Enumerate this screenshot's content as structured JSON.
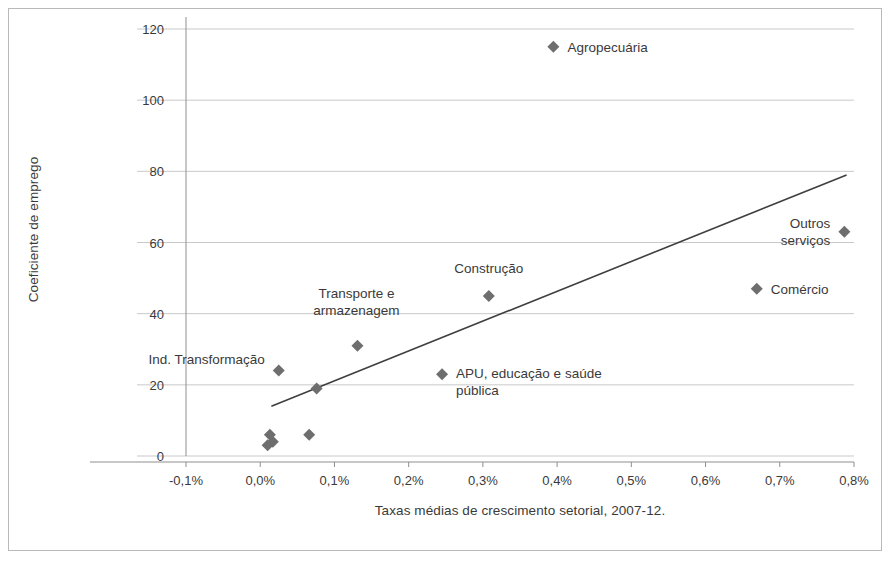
{
  "chart_data": {
    "type": "scatter",
    "title": "",
    "xlabel": "Taxas médias de crescimento setorial, 2007-12.",
    "ylabel": "Coeficiente de emprego",
    "xlim": [
      -0.1,
      0.8
    ],
    "ylim": [
      0,
      120
    ],
    "grid": true,
    "legend": "none",
    "x_unit": "%",
    "x_tick_labels": [
      "-0,1%",
      "0,0%",
      "0,1%",
      "0,2%",
      "0,3%",
      "0,4%",
      "0,5%",
      "0,6%",
      "0,7%",
      "0,8%"
    ],
    "x_tick_values": [
      -0.1,
      0.0,
      0.1,
      0.2,
      0.3,
      0.4,
      0.5,
      0.6,
      0.7,
      0.8
    ],
    "y_tick_labels": [
      "0",
      "20",
      "40",
      "60",
      "80",
      "100",
      "120"
    ],
    "y_tick_values": [
      0,
      20,
      40,
      60,
      80,
      100,
      120
    ],
    "marker": "diamond",
    "marker_color": "#6e6e6e",
    "trendline": {
      "type": "linear",
      "x_start": 0.015,
      "y_start": 14,
      "x_end": 0.79,
      "y_end": 79,
      "color": "#3f3f3f"
    },
    "points": [
      {
        "label": "Agropecuária",
        "x": 0.395,
        "y": 115,
        "label_position": "right",
        "label_dx": 14,
        "label_dy": 0
      },
      {
        "label": "Outros serviços",
        "x": 0.787,
        "y": 63,
        "label_position": "left",
        "label_dx": -14,
        "label_dy": 0
      },
      {
        "label": "Comércio",
        "x": 0.669,
        "y": 47,
        "label_position": "right",
        "label_dx": 14,
        "label_dy": 0
      },
      {
        "label": "Construção",
        "x": 0.308,
        "y": 45,
        "label_position": "center",
        "label_dx": 0,
        "label_dy": -28
      },
      {
        "label": "Transporte e\narmazenagem",
        "x": 0.131,
        "y": 31,
        "label_position": "center",
        "label_dx": -1,
        "label_dy": -44
      },
      {
        "label": "Ind. Transformação",
        "x": 0.025,
        "y": 24,
        "label_position": "left",
        "label_dx": -14,
        "label_dy": -12
      },
      {
        "label": "APU, educação e saúde\npública",
        "x": 0.245,
        "y": 23,
        "label_position": "right",
        "label_dx": 14,
        "label_dy": 8
      },
      {
        "label": "",
        "x": 0.076,
        "y": 19,
        "label_position": "none",
        "label_dx": 0,
        "label_dy": 0
      },
      {
        "label": "",
        "x": 0.066,
        "y": 6,
        "label_position": "none",
        "label_dx": 0,
        "label_dy": 0
      },
      {
        "label": "",
        "x": 0.013,
        "y": 6,
        "label_position": "none",
        "label_dx": 0,
        "label_dy": 0
      },
      {
        "label": "",
        "x": 0.017,
        "y": 4,
        "label_position": "none",
        "label_dx": 0,
        "label_dy": 0
      },
      {
        "label": "",
        "x": 0.01,
        "y": 3,
        "label_position": "none",
        "label_dx": 0,
        "label_dy": 0
      }
    ]
  },
  "style": {
    "grid_color": "#c9c9c9",
    "axis_color": "#8f8f8f",
    "text_color": "#3a3a3a",
    "border_color": "#b9b9b9",
    "background": "#ffffff"
  }
}
